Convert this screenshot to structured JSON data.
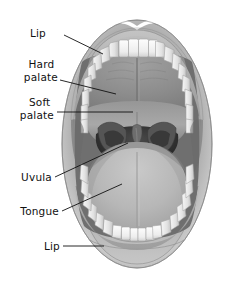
{
  "figure": {
    "view": "anterior view, mouth open",
    "style": "grayscale medical illustration",
    "background_color": "#ffffff",
    "width": 226,
    "height": 283
  },
  "palette": {
    "background": "#ffffff",
    "lip_light": "#cfcfcf",
    "lip_mid": "#a8a8a8",
    "lip_dark": "#7d7d7d",
    "lip_outline": "#6b6b6b",
    "tooth_light": "#fbfbfb",
    "tooth_shade": "#dcdcdc",
    "tooth_outline": "#9a9a9a",
    "hard_palate": "#8e8e8e",
    "soft_palate": "#9c9c9c",
    "pharynx_dark": "#3a3a3a",
    "pharynx_darkest": "#242424",
    "pillar": "#4f4f4f",
    "uvula": "#6a6a6a",
    "tongue_light": "#bdbdbd",
    "tongue_mid": "#a5a5a5",
    "tongue_shadow": "#8a8a8a",
    "leader_line": "#111111",
    "label_text": "#111111"
  },
  "labels": [
    {
      "id": "lip-upper",
      "text": "Lip",
      "text_x": 46,
      "text_y": 33,
      "lines": [
        "Lip"
      ],
      "points_to": "upper lip",
      "leader": "M64,35 L103,54"
    },
    {
      "id": "hard-palate",
      "text": "Hard palate",
      "text_x": 14,
      "text_y": 68,
      "lines": [
        "Hard",
        "palate"
      ],
      "points_to": "hard palate",
      "leader": "M60,80 L116,94"
    },
    {
      "id": "soft-palate",
      "text": "Soft palate",
      "text_x": 17,
      "text_y": 105,
      "lines": [
        "Soft",
        "palate"
      ],
      "points_to": "soft palate",
      "leader": "M57,112 L133,112"
    },
    {
      "id": "uvula",
      "text": "Uvula",
      "text_x": 22,
      "text_y": 180,
      "lines": [
        "Uvula"
      ],
      "points_to": "uvula",
      "leader": "M55,177 L128,143"
    },
    {
      "id": "tongue",
      "text": "Tongue",
      "text_x": 14,
      "text_y": 214,
      "lines": [
        "Tongue"
      ],
      "points_to": "tongue",
      "leader": "M62,211 L122,184"
    },
    {
      "id": "lip-lower",
      "text": "Lip",
      "text_x": 45,
      "text_y": 249,
      "lines": [
        "Lip"
      ],
      "points_to": "lower lip",
      "leader": "M63,246 L104,246"
    }
  ],
  "anatomy_parts": [
    {
      "name": "upper lip",
      "label": "Lip"
    },
    {
      "name": "lower lip",
      "label": "Lip"
    },
    {
      "name": "hard palate",
      "label": "Hard palate"
    },
    {
      "name": "soft palate",
      "label": "Soft palate"
    },
    {
      "name": "uvula",
      "label": "Uvula"
    },
    {
      "name": "tongue",
      "label": "Tongue"
    },
    {
      "name": "upper teeth",
      "label": ""
    },
    {
      "name": "lower teeth",
      "label": ""
    },
    {
      "name": "palatine tonsil pillars",
      "label": ""
    },
    {
      "name": "oropharynx",
      "label": ""
    }
  ],
  "teeth": {
    "upper_count": 16,
    "lower_count": 16
  }
}
